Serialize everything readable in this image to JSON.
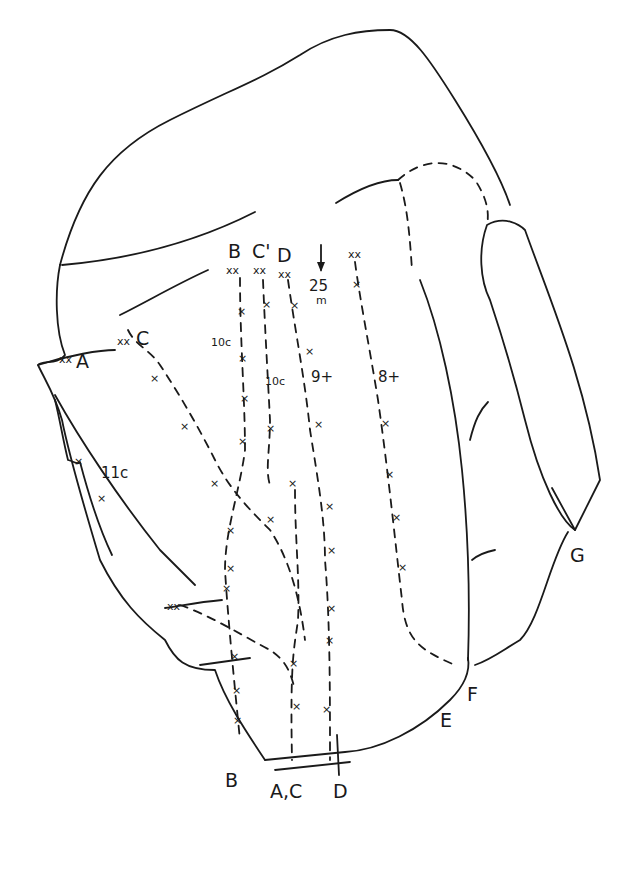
{
  "diagram": {
    "type": "climbing route topo",
    "colors": {
      "ink": "#1a1a1a",
      "background": "#ffffff"
    },
    "top_labels": {
      "B": "B",
      "C_prime": "C'",
      "D": "D"
    },
    "anchor_marker": "xx",
    "bolt_marker": "x",
    "rappel": {
      "value": "25",
      "unit": "m",
      "icon": "arrow-down"
    },
    "side_labels": {
      "A": "A",
      "C": "C",
      "G": "G"
    },
    "grades": {
      "c_start": "11c",
      "route_b": "10c",
      "route_c_prime": "10c",
      "route_d": "9+",
      "route_right": "8+"
    },
    "bottom_labels": {
      "B": "B",
      "A_C": "A,C",
      "D": "D",
      "E": "E",
      "F": "F"
    }
  }
}
